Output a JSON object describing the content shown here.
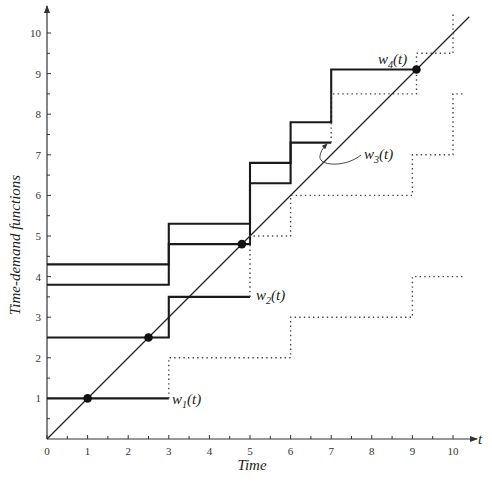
{
  "chart_data": {
    "type": "line",
    "title": "",
    "xlabel": "Time",
    "ylabel": "Time-demand functions",
    "x_axis_symbol": "t",
    "xlim": [
      0,
      10.5
    ],
    "ylim": [
      0,
      10.5
    ],
    "grid": false,
    "legend": "inline labels",
    "x_ticks": [
      0,
      1,
      2,
      3,
      4,
      5,
      6,
      7,
      8,
      9,
      10
    ],
    "y_ticks": [
      1,
      2,
      3,
      4,
      5,
      6,
      7,
      8,
      9,
      10
    ],
    "x_tick_labels": [
      "0",
      "1",
      "2",
      "3",
      "4",
      "5",
      "6",
      "7",
      "8",
      "9",
      "10"
    ],
    "y_tick_labels": [
      "1",
      "2",
      "3",
      "4",
      "5",
      "6",
      "7",
      "8",
      "9",
      "10"
    ],
    "reference_line": {
      "name": "t",
      "points": [
        [
          0,
          0
        ],
        [
          10.4,
          10.4
        ]
      ]
    },
    "series": [
      {
        "name": "w1(t)",
        "label_base": "w",
        "label_sub": "1",
        "label_tail": "(t)",
        "style": "solid",
        "points": [
          [
            0,
            1
          ],
          [
            3,
            1
          ]
        ],
        "intersection": [
          1,
          1
        ]
      },
      {
        "name": "w2(t)",
        "label_base": "w",
        "label_sub": "2",
        "label_tail": "(t)",
        "style": "solid",
        "points": [
          [
            0,
            2.5
          ],
          [
            3,
            2.5
          ],
          [
            3,
            3.5
          ],
          [
            5,
            3.5
          ]
        ],
        "intersection": [
          2.5,
          2.5
        ]
      },
      {
        "name": "w3(t)",
        "label_base": "w",
        "label_sub": "3",
        "label_tail": "(t)",
        "style": "solid",
        "points": [
          [
            0,
            3.8
          ],
          [
            3,
            3.8
          ],
          [
            3,
            4.8
          ],
          [
            5,
            4.8
          ],
          [
            5,
            6.3
          ],
          [
            6,
            6.3
          ],
          [
            6,
            7.3
          ],
          [
            7,
            7.3
          ]
        ],
        "intersection": [
          4.8,
          4.8
        ]
      },
      {
        "name": "w4(t)",
        "label_base": "w",
        "label_sub": "4",
        "label_tail": "(t)",
        "style": "solid",
        "points": [
          [
            0,
            4.3
          ],
          [
            3,
            4.3
          ],
          [
            3,
            5.3
          ],
          [
            5,
            5.3
          ],
          [
            5,
            6.8
          ],
          [
            6,
            6.8
          ],
          [
            6,
            7.8
          ],
          [
            7,
            7.8
          ],
          [
            7,
            9.1
          ],
          [
            9.1,
            9.1
          ]
        ],
        "intersection": [
          9.1,
          9.1
        ]
      },
      {
        "name": "w1 continuation",
        "style": "dotted",
        "points": [
          [
            3,
            1
          ],
          [
            3,
            2
          ],
          [
            6,
            2
          ],
          [
            6,
            3
          ],
          [
            9,
            3
          ],
          [
            9,
            4
          ],
          [
            10.3,
            4
          ]
        ]
      },
      {
        "name": "w2 continuation",
        "style": "dotted",
        "points": [
          [
            5,
            3.5
          ],
          [
            5,
            5
          ],
          [
            6,
            5
          ],
          [
            6,
            6
          ],
          [
            9,
            6
          ],
          [
            9,
            7
          ],
          [
            10,
            7
          ],
          [
            10,
            8.5
          ],
          [
            10.3,
            8.5
          ]
        ]
      },
      {
        "name": "w3 continuation",
        "style": "dotted",
        "points": [
          [
            7,
            7.3
          ],
          [
            7,
            8.5
          ],
          [
            9.1,
            8.5
          ],
          [
            9.1,
            9.5
          ],
          [
            10,
            9.5
          ],
          [
            10,
            10.5
          ]
        ]
      }
    ]
  }
}
